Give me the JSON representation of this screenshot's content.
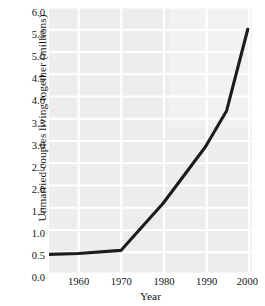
{
  "chart_data": {
    "type": "line",
    "title": "",
    "xlabel": "Year",
    "ylabel": "Unmarried couples living together (millions)",
    "xlim": [
      1953,
      2001
    ],
    "ylim": [
      0.0,
      6.0
    ],
    "grid": true,
    "legend_position": "none",
    "x_ticks": [
      "1960",
      "1970",
      "1980",
      "1990",
      "2000"
    ],
    "x_tick_values": [
      1960,
      1970,
      1980,
      1990,
      2000
    ],
    "y_ticks": [
      "0.0",
      "0.5",
      "1.0",
      "1.5",
      "2.0",
      "2.5",
      "3.0",
      "3.5",
      "4.0",
      "4.5",
      "5.0",
      "5.5",
      "6.0"
    ],
    "y_tick_values": [
      0.0,
      0.5,
      1.0,
      1.5,
      2.0,
      2.5,
      3.0,
      3.5,
      4.0,
      4.5,
      5.0,
      5.5,
      6.0
    ],
    "series": [
      {
        "name": "Unmarried couples living together",
        "color": "#1c1c1c",
        "x": [
          1953,
          1960,
          1970,
          1980,
          1990,
          1995,
          2000
        ],
        "values": [
          0.44,
          0.46,
          0.53,
          1.59,
          2.86,
          3.67,
          5.5
        ]
      }
    ],
    "line_color": "#1c1c1c",
    "plot_background": "#ededed",
    "gridline_color": "#ffffff"
  }
}
